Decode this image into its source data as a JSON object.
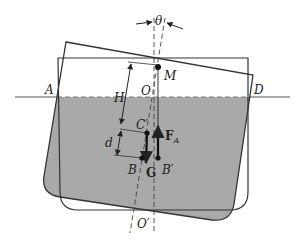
{
  "diagram": {
    "colors": {
      "water": "#a9a9a9",
      "outline": "#333333",
      "background": "#ffffff"
    },
    "labels": {
      "theta": "θ",
      "M": "M",
      "O": "O",
      "O_prime": "O′",
      "A": "A",
      "D": "D",
      "H": "H",
      "C_prime": "C′",
      "d": "d",
      "B": "B",
      "B_prime": "B′",
      "G": "G",
      "F": "F",
      "F_sub": "A"
    }
  }
}
